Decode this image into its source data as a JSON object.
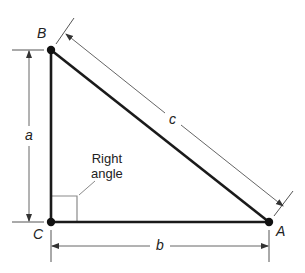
{
  "diagram": {
    "type": "right-triangle",
    "vertices": [
      {
        "id": "B",
        "label": "B"
      },
      {
        "id": "C",
        "label": "C"
      },
      {
        "id": "A",
        "label": "A"
      }
    ],
    "sides": [
      {
        "id": "a",
        "label": "a",
        "between": [
          "B",
          "C"
        ]
      },
      {
        "id": "b",
        "label": "b",
        "between": [
          "C",
          "A"
        ]
      },
      {
        "id": "c",
        "label": "c",
        "between": [
          "B",
          "A"
        ]
      }
    ],
    "annotation": {
      "line1": "Right",
      "line2": "angle",
      "at_vertex": "C"
    },
    "colors": {
      "triangle": "#1a1a1a",
      "dimension": "#555555",
      "marker": "#888888"
    }
  }
}
